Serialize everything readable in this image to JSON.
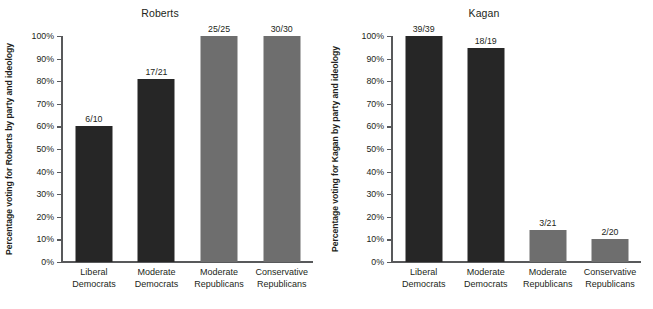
{
  "figure": {
    "background": "#ffffff",
    "panels": [
      {
        "title": "Roberts",
        "ylabel": "Percentage voting for Roberts by party and ideology"
      },
      {
        "title": "Kagan",
        "ylabel": "Percentage voting for Kagan by party and ideology"
      }
    ]
  },
  "axis": {
    "ticks": [
      "100%",
      "90%",
      "80%",
      "70%",
      "60%",
      "50%",
      "40%",
      "30%",
      "20%",
      "10%",
      "0%"
    ]
  },
  "colors": {
    "democrat_bar": "#262626",
    "republican_bar": "#6e6e6e",
    "axis": "#58595b",
    "text": "#231f20"
  },
  "chart_data": [
    {
      "type": "bar",
      "title": "Roberts",
      "xlabel": "",
      "ylabel": "Percentage voting for Roberts by party and ideology",
      "ylim": [
        0,
        100
      ],
      "yticks": [
        0,
        10,
        20,
        30,
        40,
        50,
        60,
        70,
        80,
        90,
        100
      ],
      "ytick_labels": [
        "0%",
        "10%",
        "20%",
        "30%",
        "40%",
        "50%",
        "60%",
        "70%",
        "80%",
        "90%",
        "100%"
      ],
      "grid": false,
      "legend": "none",
      "categories": [
        "Liberal Democrats",
        "Moderate Democrats",
        "Moderate Republicans",
        "Conservative Republicans"
      ],
      "category_lines": [
        [
          "Liberal",
          "Democrats"
        ],
        [
          "Moderate",
          "Democrats"
        ],
        [
          "Moderate",
          "Republicans"
        ],
        [
          "Conservative",
          "Republicans"
        ]
      ],
      "values": [
        60.0,
        81.0,
        100.0,
        100.0
      ],
      "data_labels": [
        "6/10",
        "17/21",
        "25/25",
        "30/30"
      ],
      "bar_colors": [
        "#262626",
        "#262626",
        "#6e6e6e",
        "#6e6e6e"
      ]
    },
    {
      "type": "bar",
      "title": "Kagan",
      "xlabel": "",
      "ylabel": "Percentage voting for Kagan by party and ideology",
      "ylim": [
        0,
        100
      ],
      "yticks": [
        0,
        10,
        20,
        30,
        40,
        50,
        60,
        70,
        80,
        90,
        100
      ],
      "ytick_labels": [
        "0%",
        "10%",
        "20%",
        "30%",
        "40%",
        "50%",
        "60%",
        "70%",
        "80%",
        "90%",
        "100%"
      ],
      "grid": false,
      "legend": "none",
      "categories": [
        "Liberal Democrats",
        "Moderate Democrats",
        "Moderate Republicans",
        "Conservative Republicans"
      ],
      "category_lines": [
        [
          "Liberal",
          "Democrats"
        ],
        [
          "Moderate",
          "Democrats"
        ],
        [
          "Moderate",
          "Republicans"
        ],
        [
          "Conservative",
          "Republicans"
        ]
      ],
      "values": [
        100.0,
        94.7,
        14.3,
        10.0
      ],
      "data_labels": [
        "39/39",
        "18/19",
        "3/21",
        "2/20"
      ],
      "bar_colors": [
        "#262626",
        "#262626",
        "#6e6e6e",
        "#6e6e6e"
      ]
    }
  ]
}
